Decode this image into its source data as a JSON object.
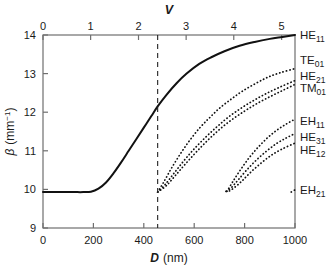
{
  "figure": {
    "top_axis_title": "V",
    "bottom_axis_title_italic": "D",
    "bottom_axis_title_unit": "(nm)",
    "left_axis_title_symbol": "β",
    "left_axis_title_unit": "(mm",
    "left_axis_title_exp": "−1",
    "left_axis_title_close": ")"
  },
  "chart_data": {
    "type": "line",
    "title": "",
    "xlabel": "D (nm)",
    "ylabel": "β (mm⁻¹)",
    "xlim": [
      0,
      1000
    ],
    "ylim": [
      9,
      14
    ],
    "x_ticks": [
      0,
      200,
      400,
      600,
      800,
      1000
    ],
    "x_tick_labels": [
      "0",
      "200",
      "400",
      "600",
      "800",
      "1000"
    ],
    "y_ticks": [
      9,
      10,
      11,
      12,
      13,
      14
    ],
    "y_tick_labels": [
      "9",
      "10",
      "11",
      "12",
      "13",
      "14"
    ],
    "top_axis": {
      "label": "V",
      "ticks": [
        0,
        1,
        2,
        3,
        4,
        5
      ],
      "tick_labels": [
        "0",
        "1",
        "2",
        "3",
        "4",
        "5"
      ],
      "lim": [
        0,
        5.28
      ],
      "x_for_V": [
        0,
        189,
        379,
        568,
        757,
        947
      ]
    },
    "grid": false,
    "legend": "right-edge-labels",
    "annotations": [
      {
        "name": "single-mode-cutoff",
        "type": "vline",
        "x": 455,
        "v": 2.405,
        "style": "dashed"
      }
    ],
    "series": [
      {
        "name": "HE11",
        "label": "HE",
        "sub": "11",
        "style": "solid",
        "label_y": 14.0,
        "points": [
          [
            0,
            9.93
          ],
          [
            60,
            9.93
          ],
          [
            120,
            9.93
          ],
          [
            160,
            9.93
          ],
          [
            190,
            9.94
          ],
          [
            220,
            10.02
          ],
          [
            250,
            10.18
          ],
          [
            280,
            10.42
          ],
          [
            310,
            10.7
          ],
          [
            340,
            11.0
          ],
          [
            370,
            11.3
          ],
          [
            400,
            11.6
          ],
          [
            430,
            11.9
          ],
          [
            455,
            12.15
          ],
          [
            490,
            12.45
          ],
          [
            530,
            12.75
          ],
          [
            570,
            13.0
          ],
          [
            620,
            13.25
          ],
          [
            670,
            13.43
          ],
          [
            720,
            13.58
          ],
          [
            780,
            13.72
          ],
          [
            840,
            13.82
          ],
          [
            900,
            13.9
          ],
          [
            950,
            13.95
          ],
          [
            1000,
            14.0
          ]
        ]
      },
      {
        "name": "TE01",
        "label": "TE",
        "sub": "01",
        "style": "dotted",
        "label_y": 13.35,
        "points": [
          [
            455,
            9.93
          ],
          [
            480,
            10.2
          ],
          [
            510,
            10.55
          ],
          [
            545,
            10.92
          ],
          [
            580,
            11.25
          ],
          [
            620,
            11.58
          ],
          [
            660,
            11.85
          ],
          [
            700,
            12.1
          ],
          [
            745,
            12.33
          ],
          [
            790,
            12.54
          ],
          [
            840,
            12.73
          ],
          [
            890,
            12.9
          ],
          [
            940,
            13.02
          ],
          [
            1000,
            13.13
          ]
        ]
      },
      {
        "name": "HE21",
        "label": "HE",
        "sub": "21",
        "style": "dotted",
        "label_y": 12.95,
        "points": [
          [
            455,
            9.93
          ],
          [
            485,
            10.13
          ],
          [
            520,
            10.42
          ],
          [
            560,
            10.75
          ],
          [
            600,
            11.05
          ],
          [
            645,
            11.35
          ],
          [
            690,
            11.62
          ],
          [
            735,
            11.87
          ],
          [
            785,
            12.1
          ],
          [
            835,
            12.3
          ],
          [
            885,
            12.48
          ],
          [
            940,
            12.65
          ],
          [
            1000,
            12.82
          ]
        ]
      },
      {
        "name": "TM01",
        "label": "TM",
        "sub": "01",
        "style": "dotted",
        "label_y": 12.62,
        "points": [
          [
            455,
            9.93
          ],
          [
            490,
            10.1
          ],
          [
            528,
            10.38
          ],
          [
            568,
            10.68
          ],
          [
            610,
            10.98
          ],
          [
            655,
            11.28
          ],
          [
            700,
            11.55
          ],
          [
            748,
            11.8
          ],
          [
            798,
            12.02
          ],
          [
            848,
            12.22
          ],
          [
            900,
            12.4
          ],
          [
            950,
            12.56
          ],
          [
            1000,
            12.72
          ]
        ]
      },
      {
        "name": "EH11",
        "label": "EH",
        "sub": "11",
        "style": "dotted",
        "label_y": 11.78,
        "points": [
          [
            730,
            9.95
          ],
          [
            755,
            10.22
          ],
          [
            785,
            10.52
          ],
          [
            818,
            10.82
          ],
          [
            852,
            11.08
          ],
          [
            888,
            11.32
          ],
          [
            925,
            11.52
          ],
          [
            962,
            11.68
          ],
          [
            1000,
            11.82
          ]
        ]
      },
      {
        "name": "HE31",
        "label": "HE",
        "sub": "31",
        "style": "dotted",
        "label_y": 11.35,
        "points": [
          [
            728,
            9.95
          ],
          [
            748,
            10.05
          ],
          [
            775,
            10.25
          ],
          [
            808,
            10.5
          ],
          [
            845,
            10.75
          ],
          [
            885,
            10.98
          ],
          [
            925,
            11.18
          ],
          [
            962,
            11.32
          ],
          [
            1000,
            11.45
          ]
        ]
      },
      {
        "name": "HE12",
        "label": "HE",
        "sub": "12",
        "style": "dotted",
        "label_y": 11.02,
        "points": [
          [
            726,
            9.95
          ],
          [
            740,
            9.96
          ],
          [
            760,
            10.05
          ],
          [
            790,
            10.22
          ],
          [
            825,
            10.45
          ],
          [
            865,
            10.68
          ],
          [
            905,
            10.88
          ],
          [
            950,
            11.05
          ],
          [
            1000,
            11.2
          ]
        ]
      },
      {
        "name": "EH21",
        "label": "EH",
        "sub": "21",
        "style": "dotted",
        "label_y": 9.98,
        "points": [
          [
            985,
            9.93
          ],
          [
            993,
            9.96
          ],
          [
            1000,
            9.99
          ]
        ]
      }
    ]
  }
}
